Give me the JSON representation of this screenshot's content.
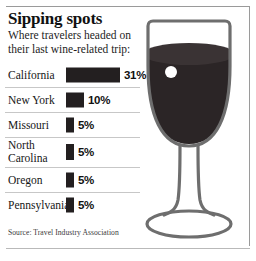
{
  "header": {
    "title": "Sipping spots",
    "subtitle_line1": "Where travelers headed on",
    "subtitle_line2": "their last wine-related trip:"
  },
  "source": "Source: Travel Industry Association",
  "colors": {
    "bar": "#231f20",
    "wine": "#2b2526",
    "wine_top": "#3a3334",
    "glass_outline": "#6e6e6e",
    "divider": "#c7c7c7",
    "frame": "#9a9a9a",
    "highlight": "#ffffff"
  },
  "graphic": {
    "name": "wine-glass",
    "has_wine": true,
    "highlight_dot": true
  },
  "chart_data": {
    "type": "bar",
    "title": "Sipping spots",
    "subtitle": "Where travelers headed on their last wine-related trip:",
    "orientation": "horizontal",
    "xlabel": "",
    "ylabel": "",
    "xlim": [
      0,
      31
    ],
    "grid": false,
    "legend": null,
    "unit": "%",
    "source": "Travel Industry Association",
    "categories": [
      "California",
      "New York",
      "Missouri",
      "North Carolina",
      "Oregon",
      "Pennsylvania"
    ],
    "values": [
      31,
      10,
      5,
      5,
      5,
      5
    ],
    "rows": [
      {
        "label": "California",
        "label_line1": "California",
        "label_line2": "",
        "value": 31,
        "value_label": "31%",
        "bar_px": 54
      },
      {
        "label": "New York",
        "label_line1": "New York",
        "label_line2": "",
        "value": 10,
        "value_label": "10%",
        "bar_px": 18
      },
      {
        "label": "Missouri",
        "label_line1": "Missouri",
        "label_line2": "",
        "value": 5,
        "value_label": "5%",
        "bar_px": 8
      },
      {
        "label": "North Carolina",
        "label_line1": "North",
        "label_line2": "Carolina",
        "value": 5,
        "value_label": "5%",
        "bar_px": 8
      },
      {
        "label": "Oregon",
        "label_line1": "Oregon",
        "label_line2": "",
        "value": 5,
        "value_label": "5%",
        "bar_px": 8
      },
      {
        "label": "Pennsylvania",
        "label_line1": "Pennsylvania",
        "label_line2": "",
        "value": 5,
        "value_label": "5%",
        "bar_px": 8
      }
    ]
  }
}
